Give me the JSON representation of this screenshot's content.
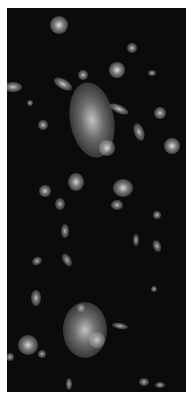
{
  "image": {
    "subject": "galaxy cluster deep-field photograph",
    "colors": {
      "background": "#0b0b0b",
      "margin": "#ffffff",
      "glow": "#e6e6e6"
    },
    "galaxies": [
      {
        "x": 52,
        "y": 17,
        "rx": 9,
        "ry": 9,
        "b": 0.9
      },
      {
        "x": 85,
        "y": 112,
        "rx": 22,
        "ry": 38,
        "b": 0.75,
        "rot": -10
      },
      {
        "x": 100,
        "y": 140,
        "rx": 8,
        "ry": 8,
        "b": 0.85
      },
      {
        "x": 110,
        "y": 62,
        "rx": 8,
        "ry": 8,
        "b": 0.9
      },
      {
        "x": 56,
        "y": 76,
        "rx": 10,
        "ry": 5,
        "b": 0.8,
        "rot": 30
      },
      {
        "x": 112,
        "y": 101,
        "rx": 10,
        "ry": 4,
        "b": 0.8,
        "rot": 25
      },
      {
        "x": 6,
        "y": 79,
        "rx": 9,
        "ry": 5,
        "b": 0.8
      },
      {
        "x": 165,
        "y": 138,
        "rx": 8,
        "ry": 8,
        "b": 0.9
      },
      {
        "x": 153,
        "y": 105,
        "rx": 6,
        "ry": 6,
        "b": 0.8
      },
      {
        "x": 132,
        "y": 124,
        "rx": 5,
        "ry": 9,
        "b": 0.75,
        "rot": -20
      },
      {
        "x": 116,
        "y": 180,
        "rx": 10,
        "ry": 9,
        "b": 0.85
      },
      {
        "x": 69,
        "y": 174,
        "rx": 8,
        "ry": 9,
        "b": 0.85
      },
      {
        "x": 38,
        "y": 183,
        "rx": 6,
        "ry": 6,
        "b": 0.8
      },
      {
        "x": 36,
        "y": 117,
        "rx": 5,
        "ry": 5,
        "b": 0.75
      },
      {
        "x": 125,
        "y": 40,
        "rx": 5,
        "ry": 5,
        "b": 0.75
      },
      {
        "x": 76,
        "y": 67,
        "rx": 5,
        "ry": 5,
        "b": 0.75
      },
      {
        "x": 145,
        "y": 65,
        "rx": 4,
        "ry": 3,
        "b": 0.7
      },
      {
        "x": 23,
        "y": 95,
        "rx": 3,
        "ry": 3,
        "b": 0.7
      },
      {
        "x": 53,
        "y": 196,
        "rx": 5,
        "ry": 6,
        "b": 0.7
      },
      {
        "x": 58,
        "y": 223,
        "rx": 4,
        "ry": 7,
        "b": 0.7
      },
      {
        "x": 30,
        "y": 253,
        "rx": 5,
        "ry": 4,
        "b": 0.7,
        "rot": -30
      },
      {
        "x": 60,
        "y": 252,
        "rx": 4,
        "ry": 7,
        "b": 0.7,
        "rot": -30
      },
      {
        "x": 129,
        "y": 232,
        "rx": 3,
        "ry": 6,
        "b": 0.7
      },
      {
        "x": 150,
        "y": 238,
        "rx": 4,
        "ry": 6,
        "b": 0.7,
        "rot": -20
      },
      {
        "x": 150,
        "y": 207,
        "rx": 4,
        "ry": 4,
        "b": 0.75
      },
      {
        "x": 29,
        "y": 290,
        "rx": 5,
        "ry": 8,
        "b": 0.75
      },
      {
        "x": 78,
        "y": 322,
        "rx": 22,
        "ry": 28,
        "b": 0.75
      },
      {
        "x": 21,
        "y": 337,
        "rx": 10,
        "ry": 10,
        "b": 0.85
      },
      {
        "x": 90,
        "y": 332,
        "rx": 8,
        "ry": 8,
        "b": 0.8
      },
      {
        "x": 113,
        "y": 318,
        "rx": 8,
        "ry": 3,
        "b": 0.7,
        "rot": 10
      },
      {
        "x": 74,
        "y": 300,
        "rx": 4,
        "ry": 4,
        "b": 0.7
      },
      {
        "x": 35,
        "y": 346,
        "rx": 4,
        "ry": 4,
        "b": 0.7
      },
      {
        "x": 3,
        "y": 349,
        "rx": 4,
        "ry": 4,
        "b": 0.7
      },
      {
        "x": 62,
        "y": 376,
        "rx": 3,
        "ry": 6,
        "b": 0.7
      },
      {
        "x": 137,
        "y": 374,
        "rx": 5,
        "ry": 4,
        "b": 0.7
      },
      {
        "x": 153,
        "y": 377,
        "rx": 5,
        "ry": 3,
        "b": 0.7
      },
      {
        "x": 147,
        "y": 281,
        "rx": 3,
        "ry": 3,
        "b": 0.7
      },
      {
        "x": 110,
        "y": 197,
        "rx": 6,
        "ry": 5,
        "b": 0.75
      }
    ]
  }
}
